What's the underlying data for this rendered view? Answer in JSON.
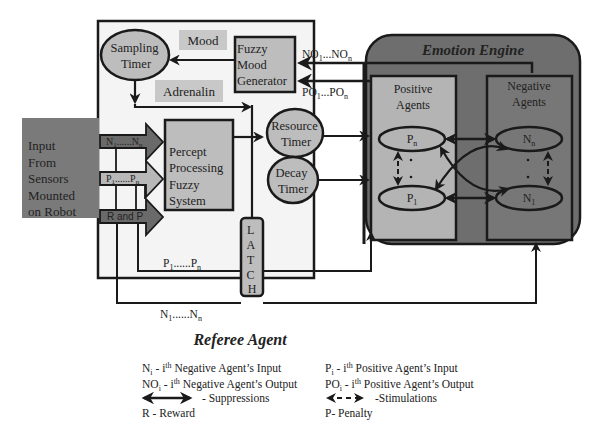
{
  "diagram": {
    "referee_agent": {
      "title": "Referee Agent"
    },
    "emotion_engine": {
      "title": "Emotion Engine"
    },
    "input_block": {
      "lines": [
        "Input",
        "From",
        "Sensors",
        "Mounted",
        "on Robot"
      ]
    },
    "sampling_timer": {
      "lines": [
        "Sampling",
        "Timer"
      ]
    },
    "mood_label": "Mood",
    "adrenalin_label": "Adrenalin",
    "fuzzy_mood_generator": {
      "lines": [
        "Fuzzy",
        "Mood",
        "Generator"
      ]
    },
    "no_signal": {
      "base": "NO",
      "sub1": "1",
      "mid": "...NO",
      "subn": "n"
    },
    "po_signal": {
      "base": "PO",
      "sub1": "1",
      "mid": "...PO",
      "subn": "n"
    },
    "percept_processing": {
      "lines": [
        "Percept",
        "Processing",
        "Fuzzy",
        "System"
      ]
    },
    "input_arrows": [
      {
        "base": "N",
        "sub1": "1",
        "mid": "......N",
        "subn": "n"
      },
      {
        "base": "P",
        "sub1": "1",
        "mid": "......P",
        "subn": "n"
      },
      {
        "label": "R and P"
      }
    ],
    "resource_timer": {
      "lines": [
        "Resource",
        "Timer"
      ]
    },
    "decay_timer": {
      "lines": [
        "Decay",
        "Timer"
      ]
    },
    "latch": {
      "letters": [
        "L",
        "A",
        "T",
        "C",
        "H"
      ]
    },
    "p_bus": {
      "base": "P",
      "sub1": "1",
      "mid": "......P",
      "subn": "n"
    },
    "n_bus": {
      "base": "N",
      "sub1": "1",
      "mid": "......N",
      "subn": "n"
    },
    "positive_agents": {
      "lines": [
        "Positive",
        "Agents"
      ],
      "top_node": {
        "base": "P",
        "sub": "n"
      },
      "bottom_node": {
        "base": "P",
        "sub": "1"
      }
    },
    "negative_agents": {
      "lines": [
        "Negative",
        "Agents"
      ],
      "top_node": {
        "base": "N",
        "sub": "n"
      },
      "bottom_node": {
        "base": "N",
        "sub": "1"
      }
    },
    "dots": "·"
  },
  "legend": {
    "ni": {
      "sym": "N",
      "sub": "i",
      "text1": " - i",
      "sup": "th",
      "text2": " Negative Agent’s Input"
    },
    "pi": {
      "sym": "P",
      "sub": "i",
      "text1": " - i",
      "sup": "th",
      "text2": " Positive Agent’s Input"
    },
    "noi": {
      "sym": "NO",
      "sub": "i",
      "text1": " - i",
      "sup": "th",
      "text2": " Negative Agent’s Output"
    },
    "poi": {
      "sym": "PO",
      "sub": "i",
      "text1": " - i",
      "sup": "th",
      "text2": " Positive Agent’s Output"
    },
    "suppressions": "- Suppressions",
    "stimulations": "-Stimulations",
    "reward": "R  - Reward",
    "penalty": "P- Penalty"
  },
  "colors": {
    "referee_bg": "#f4f4f4",
    "emotion_engine_bg": "#6e6e6e",
    "positive_bg": "#b4b4b4",
    "negative_bg": "#777777",
    "input_block_bg": "#7a7a7a",
    "box_fill": "#bdbdbd",
    "label_bg": "#c8c8c8",
    "arrow_dark": "#6a6a6a",
    "arrow_light": "#b8b8b8",
    "stroke": "#1a1a1a"
  }
}
